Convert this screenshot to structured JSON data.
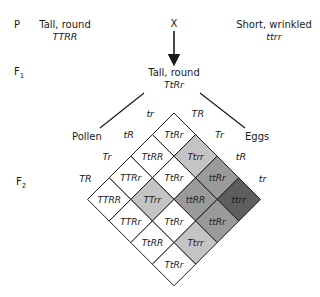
{
  "generations": {
    "p_label": "P",
    "f1_label": "F",
    "f1_sub": "1",
    "f2_label": "F",
    "f2_sub": "2"
  },
  "parents": {
    "left": {
      "phenotype": "Tall, round",
      "genotype": "TTRR"
    },
    "cross_symbol": "X",
    "right": {
      "phenotype": "Short, wrinkled",
      "genotype": "ttrr"
    }
  },
  "f1": {
    "phenotype": "Tall, round",
    "genotype": "TtRr"
  },
  "gametes": {
    "pollen_label": "Pollen",
    "eggs_label": "Eggs",
    "pollen": [
      "tr",
      "tR",
      "Tr",
      "TR"
    ],
    "eggs": [
      "TR",
      "Tr",
      "tR",
      "tr"
    ]
  },
  "colors": {
    "tall_round": "#ffffff",
    "tall_wrinkled": "#c4c4c4",
    "short_round": "#9a9a9a",
    "short_wrinkled": "#5e5e5e",
    "line": "#1a1a1a"
  },
  "punnett": {
    "rows": [
      [
        "TtRr",
        "Ttrr",
        "ttRr",
        "ttrr"
      ],
      [
        "TtRR",
        "TtRr",
        "ttRR",
        "ttRr"
      ],
      [
        "TTRr",
        "TTrr",
        "TtRr",
        "Ttrr"
      ],
      [
        "TTRR",
        "TTRr",
        "TtRR",
        "TtRr"
      ]
    ]
  }
}
